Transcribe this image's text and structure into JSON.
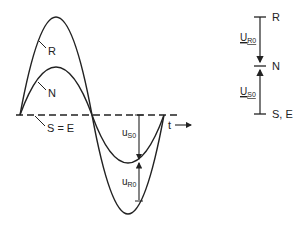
{
  "waveform": {
    "curve_r_label": "R",
    "curve_n_label": "N",
    "axis_label": "S = E",
    "time_label": "t",
    "us0_label_main": "u",
    "us0_label_sub": "S0",
    "ur0_label_main": "u",
    "ur0_label_sub": "R0"
  },
  "phasor": {
    "top_label": "R",
    "mid_label": "N",
    "bottom_label": "S, E",
    "ur0_main": "U",
    "ur0_sub": "R0",
    "us0_main": "U",
    "us0_sub": "S0"
  },
  "colors": {
    "stroke": "#222222",
    "background": "#ffffff"
  }
}
